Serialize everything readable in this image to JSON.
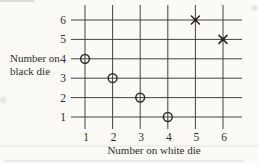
{
  "chart_data": {
    "type": "scatter",
    "title": "",
    "xlabel": "Number on white die",
    "ylabel": "Number on black die",
    "x_ticks": [
      1,
      2,
      3,
      4,
      5,
      6
    ],
    "y_ticks": [
      1,
      2,
      3,
      4,
      5,
      6
    ],
    "xlim": [
      1,
      6
    ],
    "ylim": [
      1,
      6
    ],
    "grid": true,
    "legend_position": "none",
    "series": [
      {
        "name": "circle markers",
        "marker": "circle",
        "points": [
          [
            1,
            4
          ],
          [
            2,
            3
          ],
          [
            3,
            2
          ],
          [
            4,
            1
          ]
        ]
      },
      {
        "name": "cross markers",
        "marker": "x",
        "points": [
          [
            5,
            6
          ],
          [
            6,
            5
          ]
        ]
      }
    ]
  },
  "colors": {
    "ink": "#2e2b28",
    "grid_line": "#45423e",
    "background": "#fbfaf7"
  }
}
